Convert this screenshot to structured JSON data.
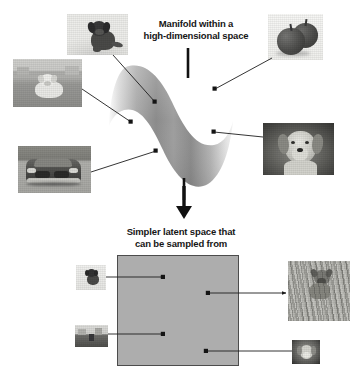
{
  "figure": {
    "title_top": "Manifold within a\nhigh-dimensional space",
    "title_bottom": "Simpler latent space that\ncan be sampled from",
    "background_color": "#ffffff",
    "text_color": "#161616"
  },
  "manifold": {
    "name": "manifold-surface",
    "description": "S-curved shaded surface representing a manifold",
    "gradient_light": "#f2f2f2",
    "gradient_mid": "#9a9a9a",
    "gradient_dark": "#6e6e6e",
    "points": [
      {
        "id": "point-top-left",
        "x": 155,
        "y": 102
      },
      {
        "id": "point-mid-left",
        "x": 131,
        "y": 122
      },
      {
        "id": "point-bottom-left",
        "x": 156,
        "y": 151
      },
      {
        "id": "point-top-right",
        "x": 215,
        "y": 89
      },
      {
        "id": "point-mid-right",
        "x": 214,
        "y": 132
      }
    ]
  },
  "latent_space": {
    "name": "latent-space-box",
    "fill_color": "#adadad",
    "border_color": "#4c4c4c",
    "points": [
      {
        "id": "latent-point-1",
        "x": 163,
        "y": 277
      },
      {
        "id": "latent-point-2",
        "x": 208,
        "y": 293
      },
      {
        "id": "latent-point-3",
        "x": 163,
        "y": 334
      },
      {
        "id": "latent-point-4",
        "x": 206,
        "y": 351
      }
    ]
  },
  "arrow": {
    "name": "downward-arrow",
    "color": "#111111",
    "from_y": 186,
    "to_y": 216
  },
  "photos_top": [
    {
      "id": "photo-puppy",
      "alt": "puppy sitting",
      "x": 67,
      "y": 14,
      "w": 61,
      "h": 41
    },
    {
      "id": "photo-apples",
      "alt": "two apples",
      "x": 268,
      "y": 14,
      "w": 55,
      "h": 46
    },
    {
      "id": "photo-white-dog",
      "alt": "white dog on path",
      "x": 13,
      "y": 59,
      "w": 69,
      "h": 48
    },
    {
      "id": "photo-golden-retriever",
      "alt": "golden retriever portrait",
      "x": 263,
      "y": 123,
      "w": 71,
      "h": 52
    },
    {
      "id": "photo-car",
      "alt": "gray sedan car front",
      "x": 18,
      "y": 146,
      "w": 73,
      "h": 47
    }
  ],
  "photos_bottom": [
    {
      "id": "photo-small-puppy",
      "alt": "small puppy",
      "x": 76,
      "y": 265,
      "w": 30,
      "h": 25
    },
    {
      "id": "photo-landscape",
      "alt": "dog in landscape",
      "x": 75,
      "y": 325,
      "w": 33,
      "h": 22
    },
    {
      "id": "photo-terrier-grass",
      "alt": "terrier in tall grass",
      "x": 288,
      "y": 261,
      "w": 62,
      "h": 60
    },
    {
      "id": "photo-dog-small",
      "alt": "dog close-up",
      "x": 292,
      "y": 340,
      "w": 28,
      "h": 24
    }
  ],
  "connectors": [
    {
      "id": "connector-puppy",
      "from": [
        113,
        55
      ],
      "to": [
        155,
        102
      ]
    },
    {
      "id": "connector-apples",
      "from": [
        272,
        58
      ],
      "to": [
        215,
        89
      ]
    },
    {
      "id": "connector-white-dog",
      "from": [
        82,
        89
      ],
      "to": [
        131,
        122
      ]
    },
    {
      "id": "connector-golden-retriever",
      "from": [
        263,
        137
      ],
      "to": [
        214,
        132
      ]
    },
    {
      "id": "connector-car",
      "from": [
        91,
        172
      ],
      "to": [
        156,
        151
      ]
    },
    {
      "id": "connector-latent-1",
      "from": [
        106,
        277
      ],
      "to": [
        163,
        277
      ]
    },
    {
      "id": "connector-latent-2",
      "from": [
        208,
        293
      ],
      "to": [
        288,
        293
      ],
      "arrow": true
    },
    {
      "id": "connector-latent-3",
      "from": [
        107,
        334
      ],
      "to": [
        163,
        334
      ]
    },
    {
      "id": "connector-latent-4",
      "from": [
        206,
        351
      ],
      "to": [
        292,
        351
      ]
    }
  ]
}
